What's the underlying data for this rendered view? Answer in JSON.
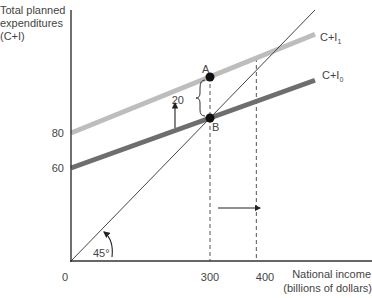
{
  "chart_data": {
    "type": "line",
    "title": "",
    "ylabel_lines": [
      "Total planned",
      "expenditures",
      "(C+I)"
    ],
    "xlabel_lines": [
      "National income",
      "(billions of dollars)"
    ],
    "origin_label": "0",
    "x_ticks": [
      {
        "value": 300,
        "label": "300"
      },
      {
        "value": 400,
        "label": "400"
      }
    ],
    "y_ticks": [
      {
        "value": 60,
        "label": "60"
      },
      {
        "value": 80,
        "label": "80"
      }
    ],
    "series": [
      {
        "name": "C+I1",
        "label_main": "C+I",
        "label_sub": "1",
        "intercept": 80,
        "slope": 0.8,
        "x": [
          0,
          440
        ],
        "color": "#bdbdbd"
      },
      {
        "name": "C+I0",
        "label_main": "C+I",
        "label_sub": "0",
        "intercept": 60,
        "slope": 0.8,
        "x": [
          0,
          440
        ],
        "color": "#6e6e6e"
      },
      {
        "name": "45-degree line",
        "intercept": 0,
        "slope": 1,
        "x": [
          0,
          435
        ],
        "color": "#444444"
      }
    ],
    "points": [
      {
        "name": "A",
        "x": 300,
        "y": 320
      },
      {
        "name": "B",
        "x": 300,
        "y": 300
      }
    ],
    "annotations": {
      "gap_label": "20",
      "angle_label": "45°",
      "shift_arrow": "horizontal arrow from 300 toward 400",
      "up_arrow": "vertical arrow showing upward shift of C+I"
    },
    "dashed_guides": [
      300,
      400
    ]
  }
}
